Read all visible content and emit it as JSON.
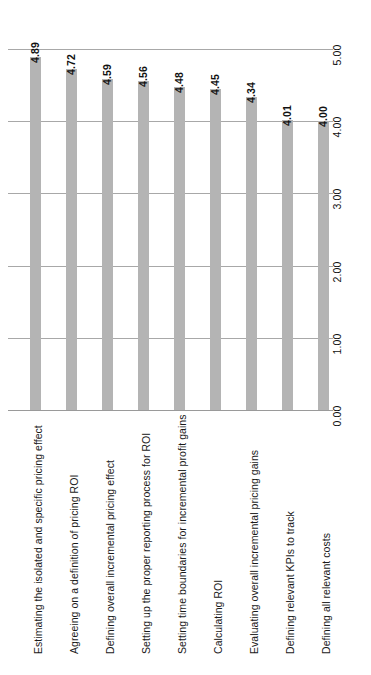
{
  "chart_data": {
    "type": "bar",
    "orientation": "vertical-bars-rotated-90",
    "title": "",
    "subtitle": "",
    "xlabel": "",
    "ylabel": "",
    "ylim": [
      0.0,
      5.0
    ],
    "grid": true,
    "legend": null,
    "bar_color": "#b4b4b4",
    "gridline_color": "#a8a8a8",
    "tick_labels": [
      "0.00",
      "1.00",
      "2.00",
      "3.00",
      "4.00",
      "5.00"
    ],
    "tick_values": [
      0.0,
      1.0,
      2.0,
      3.0,
      4.0,
      5.0
    ],
    "categories": [
      "Estimating the isolated and specific pricing effect",
      "Agreeing on a definition of pricing ROI",
      "Defining overall incremental pricing effect",
      "Setting up the proper reporting process for ROI",
      "Setting time boundaries for incremental profit gains",
      "Calculating ROI",
      "Evaluating overall incremental pricing gains",
      "Defining relevant KPIs to track",
      "Defining all relevant costs"
    ],
    "values": [
      4.89,
      4.72,
      4.59,
      4.56,
      4.48,
      4.45,
      4.34,
      4.01,
      4.0
    ],
    "value_labels": [
      "4.89",
      "4.72",
      "4.59",
      "4.56",
      "4.48",
      "4.45",
      "4.34",
      "4.01",
      "4.00"
    ]
  },
  "caption": {
    "fragment": ""
  }
}
